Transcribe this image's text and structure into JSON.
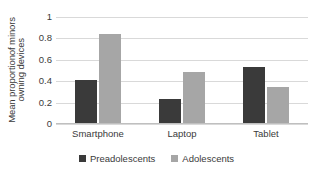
{
  "chart_data": {
    "type": "bar",
    "title": "",
    "xlabel": "",
    "ylabel_line1": "Mean proportionof minors",
    "ylabel_line2": "owning devices",
    "categories": [
      "Smartphone",
      "Laptop",
      "Tablet"
    ],
    "series": [
      {
        "name": "Preadolescents",
        "color": "#3a3a3a",
        "values": [
          0.41,
          0.23,
          0.53
        ]
      },
      {
        "name": "Adolescents",
        "color": "#a6a6a6",
        "values": [
          0.84,
          0.49,
          0.35
        ]
      }
    ],
    "ylim": [
      0,
      1
    ],
    "yticks": [
      "0",
      "0.2",
      "0.4",
      "0.6",
      "0.8",
      "1"
    ],
    "ytick_values": [
      0,
      0.2,
      0.4,
      0.6,
      0.8,
      1
    ],
    "grid": true,
    "legend_position": "bottom"
  }
}
